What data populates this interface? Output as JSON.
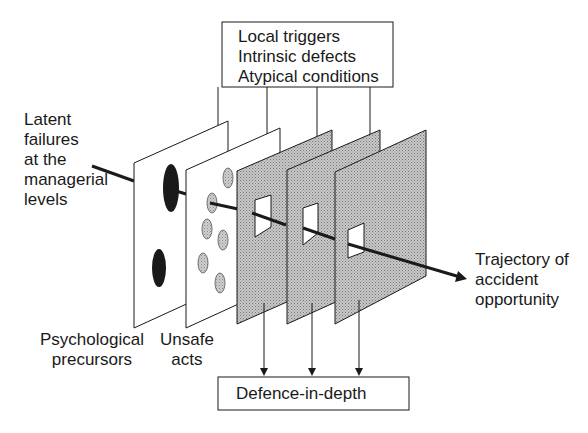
{
  "top_box": {
    "lines": [
      "Local triggers",
      "Intrinsic defects",
      "Atypical conditions"
    ]
  },
  "bottom_box": {
    "label": "Defence-in-depth"
  },
  "left_label": {
    "lines": [
      "Latent",
      "failures",
      "at the",
      "managerial",
      "levels"
    ]
  },
  "right_label": {
    "lines": [
      "Trajectory of",
      "accident",
      "opportunity"
    ]
  },
  "plane_labels": {
    "psychological": [
      "Psychological",
      "precursors"
    ],
    "unsafe": [
      "Unsafe",
      "acts"
    ]
  },
  "colors": {
    "stroke": "#1a1a1a",
    "plane_fill": "#ffffff",
    "defence_fill": "#b8b8b8",
    "hole_dark": "#1a1a1a",
    "hole_light": "#c4c4c4"
  },
  "planes": [
    {
      "name": "psychological-precursors-plane",
      "type": "white"
    },
    {
      "name": "unsafe-acts-plane",
      "type": "white"
    },
    {
      "name": "defence-plane-1",
      "type": "shaded"
    },
    {
      "name": "defence-plane-2",
      "type": "shaded"
    },
    {
      "name": "defence-plane-3",
      "type": "shaded"
    }
  ]
}
